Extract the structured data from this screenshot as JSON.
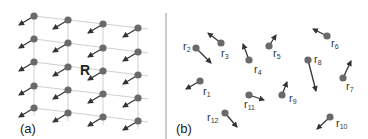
{
  "figure": {
    "panels": [
      {
        "id": "a",
        "label": "(a)",
        "center_label": "R",
        "grid_columns_x": [
          34,
          68,
          103,
          138
        ],
        "grid_rows_y": [
          [
            16,
            39,
            62,
            86,
            108
          ],
          [
            20,
            43,
            67,
            90,
            113
          ],
          [
            24,
            48,
            71,
            94,
            117
          ],
          [
            28,
            52,
            75,
            98,
            121
          ]
        ],
        "arrow_offset": [
          -15,
          9
        ]
      },
      {
        "id": "b",
        "label": "(b)",
        "points": [
          {
            "name": "r",
            "sub": "1",
            "x": 200,
            "y": 81,
            "ax": 186,
            "ay": 89,
            "lx": 203,
            "ly": 95,
            "label": "r1"
          },
          {
            "name": "r",
            "sub": "2",
            "x": 196,
            "y": 48,
            "ax": 211,
            "ay": 63,
            "lx": 183,
            "ly": 50,
            "label": "r2"
          },
          {
            "name": "r",
            "sub": "3",
            "x": 221,
            "y": 43,
            "ax": 208,
            "ay": 33,
            "lx": 221,
            "ly": 57,
            "label": "r3"
          },
          {
            "name": "r",
            "sub": "4",
            "x": 249,
            "y": 60,
            "ax": 243,
            "ay": 44,
            "lx": 254,
            "ly": 73,
            "label": "r4"
          },
          {
            "name": "r",
            "sub": "5",
            "x": 269,
            "y": 46,
            "ax": 276,
            "ay": 35,
            "lx": 273,
            "ly": 57,
            "label": "r5"
          },
          {
            "name": "r",
            "sub": "6",
            "x": 327,
            "y": 36,
            "ax": 313,
            "ay": 29,
            "lx": 331,
            "ly": 47,
            "label": "r6"
          },
          {
            "name": "r",
            "sub": "7",
            "x": 343,
            "y": 78,
            "ax": 351,
            "ay": 61,
            "lx": 346,
            "ly": 90,
            "label": "r7"
          },
          {
            "name": "r",
            "sub": "8",
            "x": 308,
            "y": 60,
            "ax": 316,
            "ay": 91,
            "lx": 314,
            "ly": 63,
            "label": "r8"
          },
          {
            "name": "r",
            "sub": "9",
            "x": 282,
            "y": 95,
            "ax": 287,
            "ay": 82,
            "lx": 289,
            "ly": 102,
            "label": "r9"
          },
          {
            "name": "r",
            "sub": "10",
            "x": 330,
            "y": 117,
            "ax": 317,
            "ay": 129,
            "lx": 336,
            "ly": 127,
            "label": "r10"
          },
          {
            "name": "r",
            "sub": "11",
            "x": 249,
            "y": 95,
            "ax": 264,
            "ay": 100,
            "lx": 244,
            "ly": 108,
            "label": "r11"
          },
          {
            "name": "r",
            "sub": "12",
            "x": 225,
            "y": 113,
            "ax": 237,
            "ay": 127,
            "lx": 207,
            "ly": 121,
            "label": "r12"
          }
        ]
      }
    ],
    "colors": {
      "dot": "#6a6a6a",
      "arrow": "#333333",
      "grid": "#cfcfcf",
      "divider": "#9a9a9a"
    }
  }
}
